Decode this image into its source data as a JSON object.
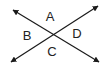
{
  "diagram": {
    "type": "intersecting-lines",
    "line_color": "#1a1a1a",
    "lines": [
      {
        "name": "line-1",
        "from": [
          13,
          10
        ],
        "to": [
          99,
          62
        ],
        "arrows": "both"
      },
      {
        "name": "line-2",
        "from": [
          11,
          62
        ],
        "to": [
          98,
          6
        ],
        "arrows": "both"
      }
    ],
    "intersection": [
      54,
      36
    ],
    "labels": [
      {
        "text": "A",
        "x": 50,
        "y": 16
      },
      {
        "text": "B",
        "x": 27,
        "y": 35
      },
      {
        "text": "C",
        "x": 52,
        "y": 51
      },
      {
        "text": "D",
        "x": 77,
        "y": 33
      }
    ]
  }
}
